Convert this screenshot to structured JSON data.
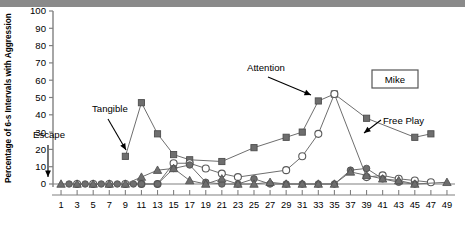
{
  "figure": {
    "subject_box_label": "Mike",
    "y_axis_title": "Percentage of 6-s Intervals with Aggression"
  },
  "annotations": [
    {
      "name": "escape",
      "text": "Escape"
    },
    {
      "name": "tangible",
      "text": "Tangible"
    },
    {
      "name": "attention",
      "text": "Attention"
    },
    {
      "name": "free-play",
      "text": "Free Play"
    }
  ],
  "chart_data": {
    "type": "line",
    "title": "",
    "subtitle": "",
    "xlabel": "",
    "ylabel": "Percentage of 6-s Intervals with Aggression",
    "xlim": [
      0,
      50
    ],
    "ylim": [
      0,
      100
    ],
    "ytick_step": 10,
    "yticks": [
      0,
      10,
      20,
      30,
      40,
      50,
      60,
      70,
      80,
      90,
      100
    ],
    "xticks": [
      1,
      3,
      5,
      7,
      9,
      11,
      13,
      15,
      17,
      19,
      21,
      23,
      25,
      27,
      29,
      31,
      33,
      35,
      37,
      39,
      41,
      43,
      45,
      47,
      49
    ],
    "grid": false,
    "legend_position": "annotated-arrows",
    "x": [
      1,
      2,
      3,
      4,
      5,
      6,
      7,
      8,
      9,
      10,
      11,
      12,
      13,
      14,
      15,
      16,
      17,
      18,
      19,
      20,
      21,
      22,
      23,
      24,
      25,
      26,
      27,
      28,
      29,
      30,
      31,
      32,
      33,
      34,
      35,
      36,
      37,
      38,
      39,
      40,
      41,
      42,
      43,
      44,
      45,
      46,
      47,
      48,
      49
    ],
    "series": [
      {
        "name": "Tangible",
        "marker": "square",
        "color": "#6e6e6e",
        "x": [
          9,
          11,
          13,
          15,
          17,
          21,
          25,
          29,
          31,
          33,
          35,
          39,
          45,
          47
        ],
        "values": [
          16,
          47,
          29,
          17,
          14,
          13,
          21,
          27,
          30,
          48,
          52,
          38,
          27,
          29
        ]
      },
      {
        "name": "Attention",
        "marker": "open-circle",
        "color": "#ffffff",
        "x": [
          3,
          5,
          7,
          9,
          11,
          13,
          15,
          17,
          19,
          21,
          23,
          29,
          31,
          33,
          35,
          39,
          41,
          43,
          45,
          47
        ],
        "values": [
          0,
          0,
          0,
          0,
          0,
          0,
          12,
          12,
          9,
          6,
          4,
          8,
          16,
          29,
          52,
          4,
          5,
          3,
          2,
          1
        ]
      },
      {
        "name": "Free Play",
        "marker": "filled-circle",
        "color": "#6e6e6e",
        "x": [
          2,
          4,
          6,
          8,
          10,
          11,
          13,
          15,
          17,
          19,
          21,
          23,
          25,
          27,
          29,
          31,
          33,
          35,
          37,
          39,
          41,
          43,
          45
        ],
        "values": [
          0,
          0,
          0,
          0,
          0,
          0,
          0,
          9,
          11,
          1,
          0,
          0,
          3,
          0,
          0,
          0,
          0,
          0,
          8,
          9,
          3,
          1,
          0
        ]
      },
      {
        "name": "Escape",
        "marker": "triangle",
        "color": "#6e6e6e",
        "x": [
          1,
          3,
          5,
          7,
          9,
          11,
          13,
          15,
          17,
          19,
          21,
          23,
          25,
          27,
          29,
          31,
          33,
          35,
          37,
          39,
          41,
          43,
          45,
          49
        ],
        "values": [
          0,
          0,
          0,
          0,
          0,
          4,
          8,
          9,
          2,
          0,
          3,
          0,
          0,
          1,
          0,
          0,
          0,
          0,
          7,
          5,
          3,
          2,
          0,
          1
        ]
      }
    ]
  }
}
